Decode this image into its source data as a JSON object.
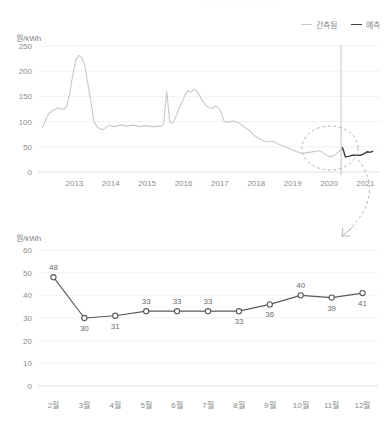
{
  "figure": {
    "ghost_title": "전력 도매가격 추이 및 전망"
  },
  "legend": {
    "items": [
      {
        "label": "간측됨",
        "color": "#c9c9c9",
        "style": "observed"
      },
      {
        "label": "예측",
        "color": "#3f3f3f",
        "style": "forecast"
      }
    ]
  },
  "annotation": {
    "ellipse_name": "forecast-highlight-ellipse",
    "arrow_name": "zoom-callout-arrow"
  },
  "chart_data": [
    {
      "id": "top",
      "type": "line",
      "title": "",
      "xlabel": "",
      "ylabel": "원/kWh",
      "ylim": [
        0,
        250
      ],
      "yticks": [
        0,
        50,
        100,
        150,
        200,
        250
      ],
      "xticks": [
        "2013",
        "2014",
        "2015",
        "2016",
        "2017",
        "2018",
        "2019",
        "2020",
        "2021"
      ],
      "xlim": [
        2012.5,
        2021.9
      ],
      "grid": true,
      "legend_position": "top-right",
      "divider_x": 2020.83,
      "series": [
        {
          "name": "간측됨",
          "color": "#c9c9c9",
          "x": [
            2012.62,
            2012.71,
            2012.79,
            2012.87,
            2012.95,
            2013.04,
            2013.12,
            2013.2,
            2013.29,
            2013.37,
            2013.45,
            2013.54,
            2013.62,
            2013.7,
            2013.79,
            2013.87,
            2013.95,
            2014.04,
            2014.12,
            2014.2,
            2014.29,
            2014.37,
            2014.45,
            2014.54,
            2014.62,
            2014.7,
            2014.79,
            2014.87,
            2014.95,
            2015.04,
            2015.12,
            2015.2,
            2015.29,
            2015.37,
            2015.45,
            2015.54,
            2015.62,
            2015.7,
            2015.79,
            2015.87,
            2015.95,
            2016.04,
            2016.12,
            2016.2,
            2016.29,
            2016.37,
            2016.45,
            2016.54,
            2016.62,
            2016.7,
            2016.79,
            2016.87,
            2016.95,
            2017.04,
            2017.12,
            2017.2,
            2017.29,
            2017.37,
            2017.45,
            2017.54,
            2017.62,
            2017.7,
            2017.79,
            2017.87,
            2017.95,
            2018.04,
            2018.12,
            2018.2,
            2018.29,
            2018.37,
            2018.45,
            2018.54,
            2018.62,
            2018.7,
            2018.79,
            2018.87,
            2018.95,
            2019.04,
            2019.12,
            2019.2,
            2019.29,
            2019.37,
            2019.45,
            2019.54,
            2019.62,
            2019.7,
            2019.79,
            2019.87,
            2019.95,
            2020.04,
            2020.12,
            2020.2,
            2020.29,
            2020.37,
            2020.45,
            2020.54,
            2020.62,
            2020.7,
            2020.79,
            2020.87
          ],
          "y": [
            88,
            103,
            115,
            120,
            124,
            127,
            126,
            124,
            130,
            155,
            190,
            222,
            231,
            228,
            210,
            175,
            140,
            100,
            90,
            86,
            84,
            89,
            92,
            91,
            90,
            92,
            93,
            92,
            91,
            92,
            93,
            92,
            90,
            91,
            92,
            91,
            90,
            90,
            91,
            90,
            95,
            160,
            99,
            97,
            110,
            125,
            138,
            152,
            162,
            158,
            164,
            160,
            150,
            140,
            132,
            128,
            126,
            131,
            128,
            118,
            100,
            99,
            100,
            101,
            99,
            96,
            92,
            88,
            84,
            78,
            72,
            68,
            65,
            62,
            60,
            60,
            61,
            58,
            55,
            52,
            50,
            48,
            45,
            42,
            40,
            38,
            37,
            38,
            39,
            40,
            41,
            42,
            40,
            36,
            33,
            30,
            32,
            36,
            42,
            45,
            43,
            38
          ]
        },
        {
          "name": "예측",
          "color": "#3f3f3f",
          "x": [
            2020.87,
            2020.95,
            2021.04,
            2021.12,
            2021.2,
            2021.29,
            2021.37,
            2021.45,
            2021.54,
            2021.62,
            2021.7
          ],
          "y": [
            48,
            30,
            31,
            33,
            33,
            33,
            33,
            36,
            40,
            39,
            41
          ]
        }
      ]
    },
    {
      "id": "bottom",
      "type": "line",
      "title": "",
      "xlabel": "",
      "ylabel": "원/kWh",
      "ylim": [
        0,
        60
      ],
      "yticks": [
        0,
        10,
        20,
        30,
        40,
        50,
        60
      ],
      "categories": [
        "2월",
        "3월",
        "4월",
        "5월",
        "6월",
        "7월",
        "8월",
        "9월",
        "10월",
        "11월",
        "12월"
      ],
      "values": [
        48,
        30,
        31,
        33,
        33,
        33,
        33,
        36,
        40,
        39,
        41
      ],
      "point_labels": [
        "48",
        "30",
        "31",
        "33",
        "33",
        "33",
        "33",
        "36",
        "40",
        "39",
        "41"
      ],
      "label_positions": [
        "above",
        "below",
        "below",
        "above",
        "above",
        "above",
        "below",
        "below",
        "above",
        "below",
        "below"
      ],
      "grid": true,
      "color": "#5a5a5a",
      "marker": "open-circle"
    }
  ]
}
